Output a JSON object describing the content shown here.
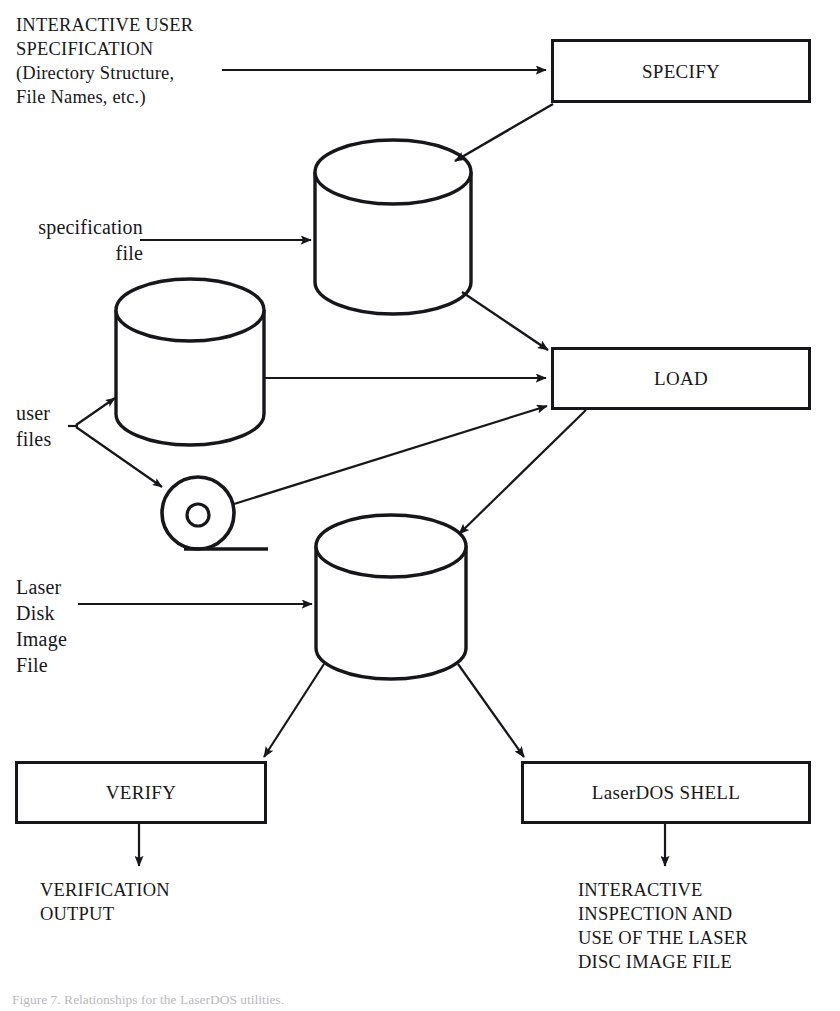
{
  "figure": {
    "domain": "Diagram",
    "type": "system-flow-diagram",
    "caption": "Figure 7. Relationships for the LaserDOS utilities."
  },
  "labels": {
    "interactive_user_spec": "INTERACTIVE USER\nSPECIFICATION\n(Directory Structure,\nFile Names, etc.)",
    "specification_file": "specification\nfile",
    "user_files": "user\nfiles",
    "laser_disk_image_file": "Laser\nDisk\nImage\nFile",
    "verification_output": "VERIFICATION\nOUTPUT",
    "interactive_inspection": "INTERACTIVE\nINSPECTION AND\nUSE OF THE LASER\nDISC IMAGE FILE"
  },
  "boxes": {
    "specify": "SPECIFY",
    "load": "LOAD",
    "verify": "VERIFY",
    "laserdos_shell": "LaserDOS SHELL"
  },
  "stores": {
    "specification_file_cylinder": "specification file store",
    "user_files_cylinder": "user files store",
    "laser_disk_image_cylinder": "laser disk image file store",
    "optical_disk": "optical disk platter"
  },
  "colors": {
    "ink": "#17171b",
    "paper": "#ffffff",
    "caption": "#b9b9bd"
  }
}
